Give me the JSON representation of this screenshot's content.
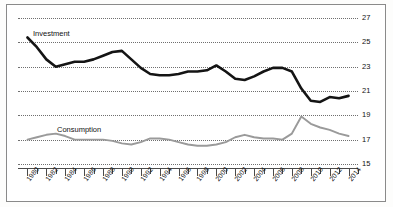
{
  "figure": {
    "top_clipped_text": "",
    "background_color": "#ffffff",
    "frame_color": "#8a8a8a"
  },
  "series_labels": {
    "investment": "Investment",
    "consumption": "Consumption"
  },
  "colors": {
    "investment": "#141414",
    "consumption": "#9a9a9a",
    "grid": "#6f6f6f",
    "axis": "#4a4a4a"
  },
  "chart_data": {
    "type": "line",
    "title": "",
    "subtitle": "",
    "xlabel": "",
    "ylabel": "",
    "xlim": [
      1979,
      2015
    ],
    "ylim": [
      15,
      27
    ],
    "grid": true,
    "y_ticks": [
      27,
      25,
      23,
      21,
      19,
      17,
      15
    ],
    "y_tick_side": "right",
    "x_ticks": [
      1980,
      1982,
      1984,
      1986,
      1988,
      1990,
      1992,
      1994,
      1996,
      1998,
      2000,
      2002,
      2004,
      2006,
      2008,
      2010,
      2012,
      2014
    ],
    "x_tick_rotation": -52,
    "x_minor_tick_interval": 1,
    "legend_position": "inline-annotation",
    "x": [
      1980,
      1981,
      1982,
      1983,
      1984,
      1985,
      1986,
      1987,
      1988,
      1989,
      1990,
      1991,
      1992,
      1993,
      1994,
      1995,
      1996,
      1997,
      1998,
      1999,
      2000,
      2001,
      2002,
      2003,
      2004,
      2005,
      2006,
      2007,
      2008,
      2009,
      2010,
      2011,
      2012,
      2013,
      2014
    ],
    "series": [
      {
        "name": "Investment",
        "color": "#141414",
        "values": [
          25.4,
          24.6,
          23.6,
          23.0,
          23.2,
          23.4,
          23.4,
          23.6,
          23.9,
          24.2,
          24.3,
          23.6,
          22.9,
          22.4,
          22.3,
          22.3,
          22.4,
          22.6,
          22.6,
          22.7,
          23.1,
          22.6,
          22.0,
          21.9,
          22.2,
          22.6,
          22.9,
          22.9,
          22.6,
          21.2,
          20.2,
          20.1,
          20.5,
          20.4,
          20.6
        ]
      },
      {
        "name": "Consumption",
        "color": "#9a9a9a",
        "values": [
          17.0,
          17.2,
          17.4,
          17.5,
          17.3,
          17.0,
          17.0,
          17.0,
          17.0,
          16.9,
          16.7,
          16.6,
          16.8,
          17.1,
          17.1,
          17.0,
          16.8,
          16.6,
          16.5,
          16.5,
          16.6,
          16.8,
          17.2,
          17.4,
          17.2,
          17.1,
          17.1,
          17.0,
          17.5,
          18.9,
          18.3,
          18.0,
          17.8,
          17.5,
          17.3
        ]
      }
    ]
  }
}
